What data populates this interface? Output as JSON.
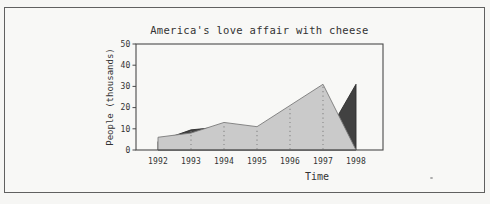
{
  "chart_data": {
    "type": "area",
    "title": "America's love affair with cheese",
    "xlabel": "Time",
    "ylabel": "People (thousands)",
    "x": [
      1992,
      1993,
      1994,
      1995,
      1996,
      1997,
      1998
    ],
    "xticks": [
      "1992",
      "1993",
      "1994",
      "1995",
      "1996",
      "1997",
      "1998"
    ],
    "yticks": [
      0,
      10,
      20,
      30,
      40,
      50
    ],
    "ylim": [
      0,
      50
    ],
    "series": [
      {
        "name": "dark-area",
        "color": "#414141",
        "edge_color": "#2e2e2e",
        "values": [
          4,
          9.5,
          11,
          10,
          13,
          4,
          31
        ]
      },
      {
        "name": "light-area",
        "color": "#cacaca",
        "edge_color": "#7a7a7a",
        "values": [
          6,
          8,
          13,
          11,
          21,
          31,
          0
        ]
      }
    ],
    "grid": "dashed vertical lines at interior year ticks, inside filled area only",
    "legend": "none"
  },
  "colors": {
    "background": "#f8f8f6",
    "frame": "#606060",
    "axis": "#4a4a4a",
    "gridline": "#878787",
    "text": "#333333"
  }
}
